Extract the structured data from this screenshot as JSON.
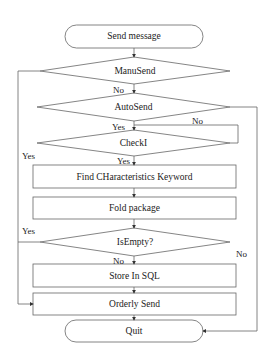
{
  "diagram": {
    "type": "flowchart",
    "nodes": {
      "start": {
        "label": "Send message",
        "shape": "terminal"
      },
      "manusend": {
        "label": "ManuSend",
        "shape": "decision"
      },
      "autosend": {
        "label": "AutoSend",
        "shape": "decision"
      },
      "check": {
        "label": "CheckI",
        "shape": "decision"
      },
      "find": {
        "label": "Find CHaracteristics Keyword",
        "shape": "process"
      },
      "fold": {
        "label": "Fold package",
        "shape": "process"
      },
      "isempty": {
        "label": "IsEmpty?",
        "shape": "decision"
      },
      "store": {
        "label": "Store In SQL",
        "shape": "process"
      },
      "orderly": {
        "label": "Orderly Send",
        "shape": "process"
      },
      "quit": {
        "label": "Quit",
        "shape": "terminal"
      }
    },
    "edge_labels": {
      "manusend_no": "No",
      "manusend_yes": "Yes",
      "autosend_yes": "Yes",
      "autosend_no_loop": "No",
      "autosend_no_right": "No",
      "check_yes": "Yes",
      "isempty_yes": "Yes",
      "isempty_no": "No"
    },
    "edges": [
      {
        "from": "start",
        "to": "manusend"
      },
      {
        "from": "manusend",
        "to": "autosend",
        "label": "No"
      },
      {
        "from": "manusend",
        "to": "orderly",
        "label": "Yes"
      },
      {
        "from": "autosend",
        "to": "check",
        "label": "Yes"
      },
      {
        "from": "autosend",
        "to": "check",
        "label": "No"
      },
      {
        "from": "autosend",
        "to": "quit",
        "label": "No"
      },
      {
        "from": "check",
        "to": "find",
        "label": "Yes"
      },
      {
        "from": "find",
        "to": "fold"
      },
      {
        "from": "fold",
        "to": "isempty"
      },
      {
        "from": "isempty",
        "to": "orderly",
        "label": "Yes"
      },
      {
        "from": "isempty",
        "to": "store",
        "label": "No"
      },
      {
        "from": "store",
        "to": "orderly"
      },
      {
        "from": "orderly",
        "to": "quit"
      }
    ],
    "colors": {
      "stroke": "#555555",
      "fill": "#ffffff",
      "text": "#222222"
    }
  }
}
